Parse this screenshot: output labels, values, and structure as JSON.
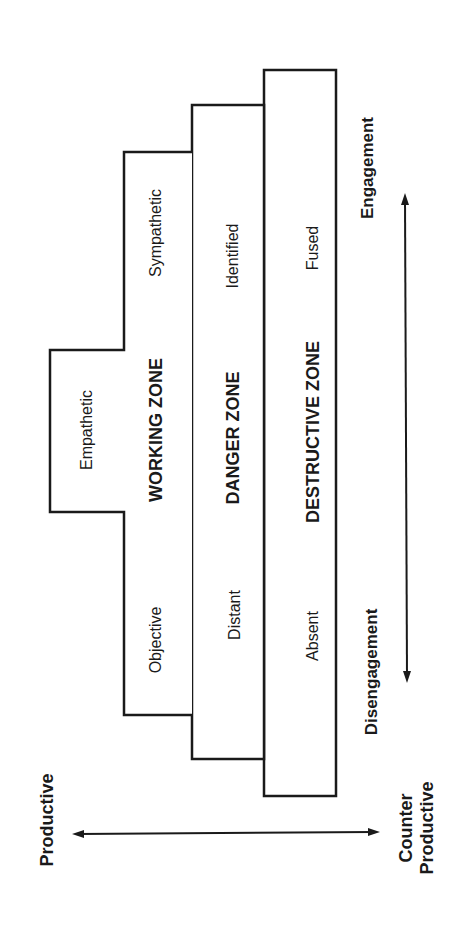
{
  "diagram": {
    "zones": [
      {
        "name": "WORKING ZONE",
        "levels": {
          "disengaged": "Objective",
          "middle": "Empathetic",
          "engaged": "Sympathetic"
        }
      },
      {
        "name": "DANGER ZONE",
        "levels": {
          "disengaged": "Distant",
          "engaged": "Identified"
        }
      },
      {
        "name": "DESTRUCTIVE ZONE",
        "levels": {
          "disengaged": "Absent",
          "engaged": "Fused"
        }
      }
    ],
    "engagement_axis": {
      "start_label": "Disengagement",
      "end_label": "Engagement"
    },
    "productivity_axis": {
      "start_label": "Productive",
      "end_label_line1": "Counter",
      "end_label_line2": "Productive"
    },
    "colors": {
      "line": "#1a1a1a",
      "background": "#ffffff"
    }
  }
}
